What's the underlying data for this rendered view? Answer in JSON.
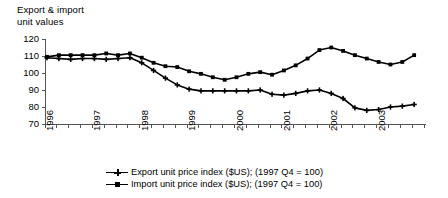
{
  "chart_data": {
    "type": "line",
    "title": "Export & import\nunit values",
    "title_line1": "Export & import",
    "title_line2": "unit values",
    "xlabel": "",
    "ylabel": "",
    "ylim": [
      70,
      120
    ],
    "ytick_labels": [
      "120",
      "110",
      "100",
      "90",
      "80",
      "70"
    ],
    "ytick_values": [
      120,
      110,
      100,
      90,
      80,
      70
    ],
    "xtick_labels": [
      "1996",
      "1997",
      "1998",
      "1999",
      "2000",
      "2001",
      "2002",
      "2003"
    ],
    "xtick_values": [
      1996,
      1997,
      1998,
      1999,
      2000,
      2001,
      2002,
      2003
    ],
    "minor_ticks": "quarterly",
    "grid": false,
    "legend_position": "below-centre",
    "x": [
      "1996 Q1",
      "1996 Q2",
      "1996 Q3",
      "1996 Q4",
      "1997 Q1",
      "1997 Q2",
      "1997 Q3",
      "1997 Q4",
      "1998 Q1",
      "1998 Q2",
      "1998 Q3",
      "1998 Q4",
      "1999 Q1",
      "1999 Q2",
      "1999 Q3",
      "1999 Q4",
      "2000 Q1",
      "2000 Q2",
      "2000 Q3",
      "2000 Q4",
      "2001 Q1",
      "2001 Q2",
      "2001 Q3",
      "2001 Q4",
      "2002 Q1",
      "2002 Q2",
      "2002 Q3",
      "2002 Q4",
      "2003 Q1",
      "2003 Q2",
      "2003 Q3",
      "2003 Q4"
    ],
    "series": [
      {
        "name": "Export unit price index ($US); (1997 Q4 = 100)",
        "marker": "plus",
        "values": [
          109.0,
          108.5,
          108.0,
          108.5,
          108.5,
          108.0,
          108.5,
          109.0,
          106.0,
          101.5,
          97.0,
          93.0,
          90.5,
          89.5,
          89.5,
          89.5,
          89.5,
          89.5,
          90.0,
          87.5,
          87.0,
          88.0,
          89.5,
          90.0,
          88.0,
          85.0,
          79.5,
          78.0,
          78.5,
          80.0,
          80.5,
          81.5
        ]
      },
      {
        "name": "Import unit price index ($US); (1997 Q4 = 100)",
        "marker": "square",
        "values": [
          109.5,
          110.5,
          110.5,
          110.5,
          110.5,
          111.5,
          110.5,
          111.5,
          109.0,
          106.0,
          104.0,
          103.5,
          101.0,
          99.5,
          97.5,
          96.0,
          97.5,
          99.5,
          100.5,
          99.0,
          101.5,
          104.5,
          108.5,
          113.5,
          115.0,
          113.0,
          110.5,
          108.5,
          106.5,
          105.0,
          106.5,
          110.5
        ]
      }
    ]
  },
  "legend": {
    "items": [
      {
        "marker": "plus",
        "label": "Export unit price index ($US); (1997 Q4 = 100)"
      },
      {
        "marker": "square",
        "label": "Import unit price index ($US); (1997 Q4 = 100)"
      }
    ]
  },
  "colors": {
    "series": "#000000",
    "axis": "#555555",
    "background": "#ffffff",
    "text": "#000000"
  }
}
